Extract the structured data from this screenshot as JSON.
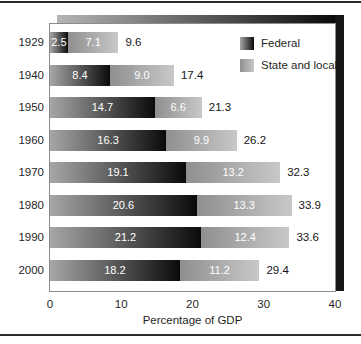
{
  "chart_data": {
    "type": "bar",
    "orientation": "horizontal",
    "stacked": true,
    "categories": [
      "1929",
      "1940",
      "1950",
      "1960",
      "1970",
      "1980",
      "1990",
      "2000"
    ],
    "series": [
      {
        "name": "Federal",
        "values": [
          2.5,
          8.4,
          14.7,
          16.3,
          19.1,
          20.6,
          21.2,
          18.2
        ]
      },
      {
        "name": "State and local",
        "values": [
          7.1,
          9.0,
          6.6,
          9.9,
          13.2,
          13.3,
          12.4,
          11.2
        ]
      }
    ],
    "totals": [
      9.6,
      17.4,
      21.3,
      26.2,
      32.3,
      33.9,
      33.6,
      29.4
    ],
    "xlabel": "Percentage of GDP",
    "xlim": [
      0,
      40
    ],
    "xticks": [
      0,
      10,
      20,
      30,
      40
    ],
    "legend_position": "top-right",
    "grid": false,
    "value_label_style": "white-inside-segment",
    "total_label_style": "black-right-of-bar"
  },
  "legend": {
    "federal": "Federal",
    "state_local": "State and local"
  },
  "colors": {
    "federal_gradient_start": "#a6a6a6",
    "federal_gradient_end": "#0a0a0a",
    "state_gradient_start": "#8f8f8f",
    "state_gradient_end": "#c8c8c8",
    "shadow_top_start": "#b5b5b5",
    "shadow_top_end": "#050505",
    "shadow_right": "#161616",
    "frame_rule": "#2b2b2b",
    "plot_border": "#8c8c8c",
    "value_text": "#ffffff",
    "label_text": "#1f1f1f"
  },
  "layout_values": {
    "px_per_unit": 7.125,
    "row_top_start": 32,
    "row_pitch": 32.5
  }
}
